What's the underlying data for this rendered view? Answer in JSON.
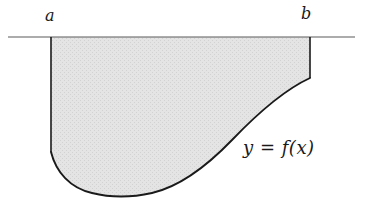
{
  "figure": {
    "kind": "calculus-signed-area-diagram",
    "background_color": "#ffffff",
    "curve_color": "#1a1a1a",
    "fill_color": "#e3e3e3",
    "axis_color": "#5a5a5a",
    "labels": {
      "left_endpoint": "a",
      "right_endpoint": "b",
      "function": "y = f(x)"
    },
    "axis": {
      "name": "x-axis",
      "y": 37,
      "x_start": 8,
      "x_end": 355
    },
    "region": {
      "name": "shaded-region-below-axis",
      "left_edge_x": 51,
      "right_edge_x": 310,
      "top_y": 37,
      "left_edge_bottom_y": 152,
      "right_edge_bottom_y": 78,
      "lowest_point": {
        "x": 148,
        "y": 196
      }
    },
    "curve_path": "M 51 152 C 56 172 70 188 92 193 C 112 198 134 197 152 193 C 178 187 206 167 232 140 C 256 115 286 89 310 78",
    "region_path": "M 51 37 L 51 152 C 56 172 70 188 92 193 C 112 198 134 197 152 193 C 178 187 206 167 232 140 C 256 115 286 89 310 78 L 310 37 Z"
  }
}
